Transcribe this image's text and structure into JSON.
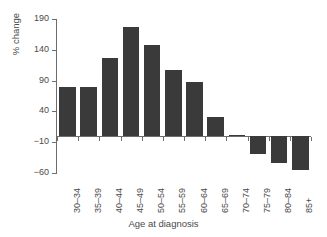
{
  "chart_data": {
    "type": "bar",
    "title": "",
    "xlabel": "Age at diagnosis",
    "ylabel": "% change",
    "categories": [
      "30–34",
      "35–39",
      "40–44",
      "45–49",
      "50–54",
      "55–59",
      "60–64",
      "65–69",
      "70–74",
      "75–79",
      "80–84",
      "85+"
    ],
    "values": [
      80,
      79,
      127,
      177,
      147,
      107,
      87,
      31,
      2,
      -29,
      -44,
      -55
    ],
    "ylim": [
      -60,
      190
    ],
    "yticks": [
      190,
      140,
      90,
      40,
      -10,
      -60
    ],
    "ytick_labels": [
      "190",
      "140",
      "90",
      "40",
      "−10",
      "−60"
    ],
    "grid": false,
    "legend": null,
    "bar_color": "#3a3a3a",
    "axis_color": "#6d6d6d",
    "text_color": "#4a4a4a",
    "background": "#ffffff"
  }
}
